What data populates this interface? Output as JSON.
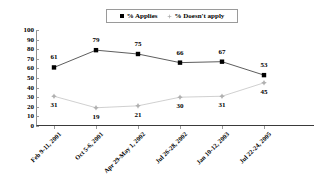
{
  "chart_data": {
    "type": "line",
    "title": "",
    "xlabel": "",
    "ylabel": "",
    "ylim": [
      0,
      100
    ],
    "ytick_step": 10,
    "yticks": [
      100,
      90,
      80,
      70,
      60,
      50,
      40,
      30,
      20,
      10,
      0
    ],
    "grid": false,
    "legend_position": "top-center",
    "categories": [
      "Feb 9-11, 2001",
      "Oct 5-6, 2001",
      "Apr 29-May 1, 2002",
      "Jul 26-28, 2002",
      "Jan 10-12, 2003",
      "Jul 22-24, 2005"
    ],
    "series": [
      {
        "name": "% Applies",
        "marker": "square",
        "color": "#000000",
        "values": [
          61,
          79,
          75,
          66,
          67,
          53
        ]
      },
      {
        "name": "% Doesn't apply",
        "marker": "star",
        "color": "#b0b0b0",
        "values": [
          31,
          19,
          21,
          30,
          31,
          45
        ]
      }
    ]
  },
  "legend": {
    "entries": [
      {
        "label": "% Applies",
        "marker": "square-marker-icon"
      },
      {
        "label": "% Doesn't apply",
        "marker": "star-marker-icon"
      }
    ]
  },
  "colors": {
    "series_applies": "#000000",
    "series_doesnt_apply": "#b0b0b0",
    "axis": "#8f8f8f",
    "baseline": "#3a3a3a",
    "background": "#ffffff"
  }
}
